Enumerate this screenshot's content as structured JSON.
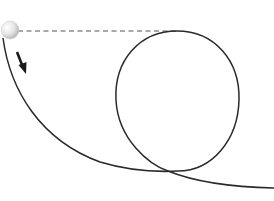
{
  "diagram": {
    "colors": {
      "background": "#ffffff",
      "track": "#2a2a2a",
      "dashed_line": "#555555",
      "arrow": "#1a1a1a",
      "ball_light": "#f4f4f4",
      "ball_dark": "#bdbdbd"
    },
    "elements": {
      "ball": {
        "cx": 10,
        "cy": 30,
        "r": 9
      },
      "dashed_reference_line": {
        "x1": 18,
        "y1": 31,
        "x2": 176,
        "y2": 31
      },
      "direction_arrow": {
        "x1": 17,
        "y1": 52,
        "x2": 25,
        "y2": 72
      },
      "loop": {
        "cx": 177,
        "cy": 101,
        "rx": 62,
        "ry": 70
      }
    }
  }
}
